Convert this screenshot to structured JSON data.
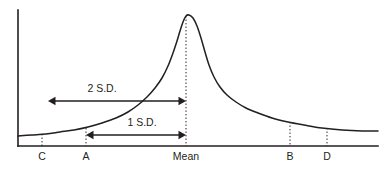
{
  "figure": {
    "type": "statistical-distribution-diagram",
    "background_color": "#ffffff",
    "ink_color": "#231f20",
    "width": 382,
    "height": 172
  },
  "chart_data": {
    "type": "line",
    "title": "",
    "subtitle": "",
    "xlabel": "",
    "ylabel": "",
    "grid": false,
    "legend": null,
    "axes": {
      "x_axis": {
        "x_start": 18,
        "x_end": 378,
        "y": 146
      },
      "y_axis": {
        "x": 18,
        "y_start": 10,
        "y_end": 146
      }
    },
    "curve": {
      "name": "distribution",
      "peak_x": 186,
      "peak_y": 15,
      "baseline_y": 146,
      "left_tail_y": 136,
      "right_tail_y": 131,
      "points": [
        [
          18,
          136
        ],
        [
          32,
          135
        ],
        [
          46,
          134
        ],
        [
          60,
          132
        ],
        [
          74,
          130
        ],
        [
          88,
          127
        ],
        [
          102,
          123
        ],
        [
          116,
          118
        ],
        [
          128,
          112
        ],
        [
          138,
          105
        ],
        [
          147,
          97
        ],
        [
          155,
          88
        ],
        [
          162,
          78
        ],
        [
          168,
          66
        ],
        [
          173,
          53
        ],
        [
          177,
          41
        ],
        [
          180,
          31
        ],
        [
          183,
          22
        ],
        [
          186,
          16
        ],
        [
          189,
          15
        ],
        [
          193,
          18
        ],
        [
          197,
          26
        ],
        [
          201,
          38
        ],
        [
          205,
          52
        ],
        [
          209,
          65
        ],
        [
          214,
          77
        ],
        [
          220,
          87
        ],
        [
          227,
          95
        ],
        [
          236,
          102
        ],
        [
          246,
          108
        ],
        [
          258,
          113
        ],
        [
          272,
          118
        ],
        [
          288,
          122
        ],
        [
          304,
          125
        ],
        [
          322,
          128
        ],
        [
          342,
          130
        ],
        [
          362,
          131
        ],
        [
          378,
          131
        ]
      ]
    },
    "x_ticks": [
      {
        "id": "C",
        "label": "C",
        "x": 42,
        "curve_y": 134,
        "label_y": 160
      },
      {
        "id": "A",
        "label": "A",
        "x": 86,
        "curve_y": 128,
        "label_y": 160
      },
      {
        "id": "Mean",
        "label": "Mean",
        "x": 186,
        "curve_y": 16,
        "label_y": 160
      },
      {
        "id": "B",
        "label": "B",
        "x": 290,
        "curve_y": 122,
        "label_y": 160
      },
      {
        "id": "D",
        "label": "D",
        "x": 327,
        "curve_y": 128,
        "label_y": 160
      }
    ],
    "annotations": [
      {
        "id": "two-sd",
        "label": "2 S.D.",
        "arrow_y": 101,
        "x_from": 48,
        "x_to": 186,
        "label_x": 102,
        "label_y": 92,
        "double_headed": true,
        "spans_from_tick": "C",
        "spans_to_tick": "Mean"
      },
      {
        "id": "one-sd",
        "label": "1 S.D.",
        "arrow_y": 135,
        "x_from": 86,
        "x_to": 186,
        "label_x": 142,
        "label_y": 126,
        "double_headed": true,
        "spans_from_tick": "A",
        "spans_to_tick": "Mean"
      }
    ]
  }
}
